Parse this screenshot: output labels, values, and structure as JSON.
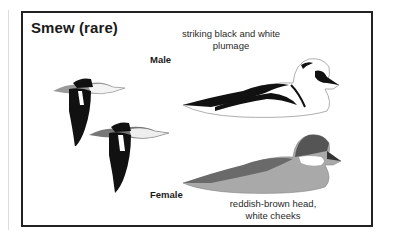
{
  "title": "Smew (rare)",
  "male": {
    "label": "Male",
    "note_line1": "striking black and white",
    "note_line2": "plumage"
  },
  "female": {
    "label": "Female",
    "note_line1": "reddish-brown head,",
    "note_line2": "white cheeks"
  },
  "illustrations": [
    {
      "name": "male-swimming",
      "description": "white duck with black eye patch, black back lines",
      "rendered_fill": "grayscale (white/black)"
    },
    {
      "name": "female-swimming",
      "description": "gray duck with dark head cap and white cheek; caption describes head as reddish-brown, but image renders it in dark gray",
      "rendered_fill": "grayscale (dark gray head)"
    },
    {
      "name": "male-flying-1",
      "description": "flying smew, black wings"
    },
    {
      "name": "male-flying-2",
      "description": "flying smew, black wings"
    }
  ],
  "colors": {
    "border": "#222222",
    "text": "#1a1a1a",
    "black_plumage": "#111111",
    "gray_plumage": "#8a8a8a",
    "female_head": "#555555",
    "female_head_note": "rendered as dark gray; caption says reddish-brown but no color is present in the image"
  }
}
